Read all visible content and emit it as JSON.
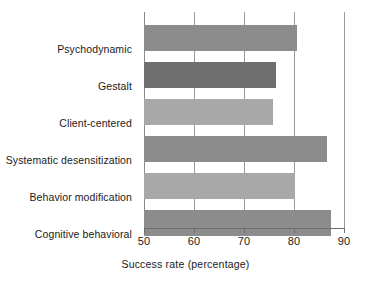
{
  "chart_data": {
    "type": "bar",
    "orientation": "horizontal",
    "title": "",
    "xlabel": "Success rate (percentage)",
    "ylabel": "",
    "categories": [
      "Psychodynamic",
      "Gestalt",
      "Client-centered",
      "Systematic desensitization",
      "Behavior modification",
      "Cognitive behavioral"
    ],
    "values": [
      80.5,
      76.4,
      75.8,
      86.6,
      80.2,
      87.4
    ],
    "bar_colors": [
      "#8c8c8c",
      "#6f6f6f",
      "#a8a8a8",
      "#8c8c8c",
      "#a8a8a8",
      "#8c8c8c"
    ],
    "xlim": [
      50,
      90
    ],
    "xticks": [
      50,
      60,
      70,
      80,
      90
    ],
    "xtick_labels": [
      "50",
      "60",
      "70",
      "80",
      "90"
    ],
    "grid": true,
    "grid_axis": "x",
    "legend": false,
    "legend_position": "none",
    "background_color": "#ffffff",
    "gridline_color": "#9a9a9a",
    "axis_color": "#6f6f6f",
    "text_color": "#1a1a1a"
  }
}
